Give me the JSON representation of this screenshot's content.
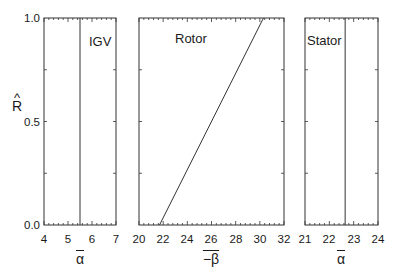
{
  "chart_data": [
    {
      "type": "line",
      "title": "IGV",
      "xlabel": "ᾱ",
      "ylabel": "R̂",
      "xlim": [
        4,
        7
      ],
      "ylim": [
        0.0,
        1.0
      ],
      "xticks": [
        "4",
        "5",
        "6",
        "7"
      ],
      "yticks": [
        "0.0",
        "0.5",
        "1.0"
      ],
      "series": [
        {
          "name": "IGV",
          "x": [
            5.5,
            5.5
          ],
          "y": [
            0.0,
            1.0
          ]
        }
      ]
    },
    {
      "type": "line",
      "title": "Rotor",
      "xlabel": "−β̄",
      "xlim": [
        20,
        32
      ],
      "ylim": [
        0.0,
        1.0
      ],
      "xticks": [
        "20",
        "22",
        "24",
        "26",
        "28",
        "30",
        "32"
      ],
      "series": [
        {
          "name": "Rotor",
          "x": [
            21.7,
            30.3
          ],
          "y": [
            0.0,
            1.0
          ]
        }
      ]
    },
    {
      "type": "line",
      "title": "Stator",
      "xlabel": "ᾱ",
      "xlim": [
        21,
        24
      ],
      "ylim": [
        0.0,
        1.0
      ],
      "xticks": [
        "21",
        "22",
        "23",
        "24"
      ],
      "series": [
        {
          "name": "Stator",
          "x": [
            22.65,
            22.65
          ],
          "y": [
            0.0,
            1.0
          ]
        }
      ]
    }
  ],
  "labels": {
    "y_axis": "R",
    "y_hat": "^",
    "igv_title": "IGV",
    "rotor_title": "Rotor",
    "stator_title": "Stator",
    "igv_xlabel": "α",
    "rotor_xlabel": "−β",
    "stator_xlabel": "α",
    "yticks": [
      "1.0",
      "0.5",
      "0.0"
    ],
    "igv_xticks": [
      "4",
      "5",
      "6",
      "7"
    ],
    "rotor_xticks": [
      "20",
      "22",
      "24",
      "26",
      "28",
      "30",
      "32"
    ],
    "stator_xticks": [
      "21",
      "22",
      "23",
      "24"
    ]
  }
}
